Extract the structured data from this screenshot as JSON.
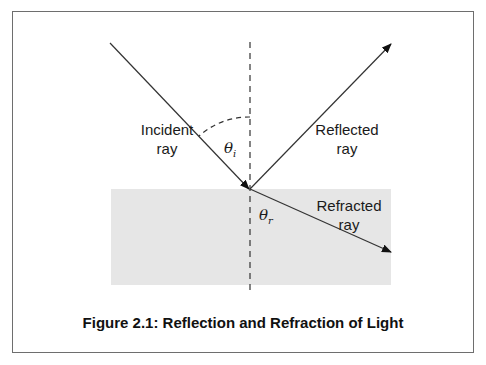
{
  "figure": {
    "caption": "Figure 2.1: Reflection and Refraction of Light",
    "labels": {
      "incident": [
        "Incident",
        "ray"
      ],
      "reflected": [
        "Reflected",
        "ray"
      ],
      "refracted": [
        "Refracted",
        "ray"
      ],
      "theta_i": {
        "symbol": "θ",
        "sub": "i"
      },
      "theta_r": {
        "symbol": "θ",
        "sub": "r"
      }
    },
    "colors": {
      "medium_fill": "#e6e6e6",
      "line": "#222222",
      "frame": "#6e6e6e"
    }
  }
}
